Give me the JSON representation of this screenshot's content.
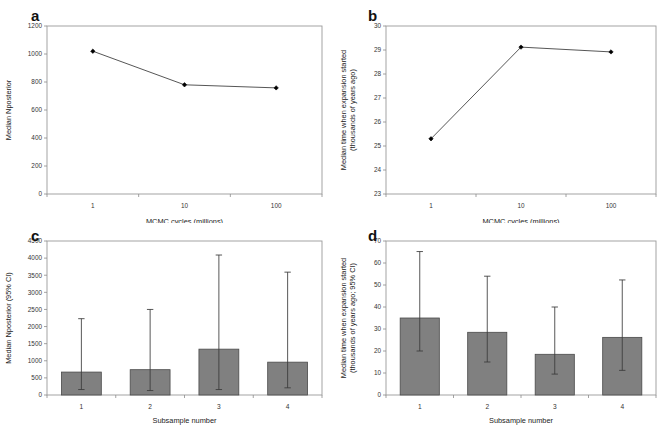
{
  "figure": {
    "background": "#ffffff",
    "bar_color": "#808080",
    "bar_border_color": "#4a4a4a",
    "line_color": "#2b2b2b",
    "marker_color": "#000000",
    "axis_color": "#8c8c8c",
    "width": 668,
    "height": 446
  },
  "panels": [
    {
      "letter": "a",
      "chart_data": {
        "type": "line",
        "title": "",
        "xlabel": "MCMC cycles (millions)",
        "ylabel": "Median Nposterior",
        "x_scale": "log",
        "categories": [
          "1",
          "10",
          "100"
        ],
        "x": [
          1,
          10,
          100
        ],
        "values": [
          1020,
          780,
          758
        ],
        "xticklabels": [
          "1",
          "10",
          "100"
        ],
        "yticklabels": [
          "0",
          "200",
          "400",
          "600",
          "800",
          "1000",
          "1200"
        ],
        "yticks": [
          0,
          200,
          400,
          600,
          800,
          1000,
          1200
        ],
        "ylim": [
          0,
          1200
        ],
        "grid": false,
        "legend": "none",
        "markers": "filled-diamond"
      }
    },
    {
      "letter": "b",
      "chart_data": {
        "type": "line",
        "title": "",
        "xlabel": "MCMC cycles (millions)",
        "ylabel": "Median time when expansion started (thousands of years ago)",
        "ylabel_line1": "Median time when expansion started",
        "ylabel_line2": "(thousands of years ago)",
        "x_scale": "log",
        "categories": [
          "1",
          "10",
          "100"
        ],
        "x": [
          1,
          10,
          100
        ],
        "values": [
          25.3,
          29.12,
          28.92
        ],
        "xticklabels": [
          "1",
          "10",
          "100"
        ],
        "yticklabels": [
          "23",
          "24",
          "25",
          "26",
          "27",
          "28",
          "29",
          "30"
        ],
        "yticks": [
          23,
          24,
          25,
          26,
          27,
          28,
          29,
          30
        ],
        "ylim": [
          23,
          30
        ],
        "grid": false,
        "legend": "none",
        "markers": "filled-diamond"
      }
    },
    {
      "letter": "c",
      "chart_data": {
        "type": "bar",
        "title": "",
        "xlabel": "Subsample number",
        "ylabel": "Median Nposterior (95% CI)",
        "categories": [
          "1",
          "2",
          "3",
          "4"
        ],
        "values": [
          670,
          740,
          1340,
          960
        ],
        "error_low": [
          160,
          130,
          160,
          210
        ],
        "error_high": [
          2230,
          2500,
          4090,
          3590
        ],
        "error_type": "95% CI",
        "xticklabels": [
          "1",
          "2",
          "3",
          "4"
        ],
        "yticklabels": [
          "0",
          "500",
          "1000",
          "1500",
          "2000",
          "2500",
          "3000",
          "3500",
          "4000",
          "4500"
        ],
        "yticks": [
          0,
          500,
          1000,
          1500,
          2000,
          2500,
          3000,
          3500,
          4000,
          4500
        ],
        "ylim": [
          0,
          4500
        ],
        "grid": false,
        "legend": "none"
      }
    },
    {
      "letter": "d",
      "chart_data": {
        "type": "bar",
        "title": "",
        "xlabel": "Subsample number",
        "ylabel": "Median time when expansion started (thousands of years ago; 95% CI)",
        "ylabel_line1": "Median time when expansion started",
        "ylabel_line2": "(thousands of years ago; 95% CI)",
        "categories": [
          "1",
          "2",
          "3",
          "4"
        ],
        "values": [
          35.0,
          28.5,
          18.5,
          26.2
        ],
        "error_low": [
          20.0,
          15.0,
          9.5,
          11.2
        ],
        "error_high": [
          65.2,
          54.0,
          40.0,
          52.3
        ],
        "error_type": "95% CI",
        "xticklabels": [
          "1",
          "2",
          "3",
          "4"
        ],
        "yticklabels": [
          "0",
          "10",
          "20",
          "30",
          "40",
          "50",
          "60",
          "70"
        ],
        "yticks": [
          0,
          10,
          20,
          30,
          40,
          50,
          60,
          70
        ],
        "ylim": [
          0,
          70
        ],
        "grid": false,
        "legend": "none"
      }
    }
  ]
}
